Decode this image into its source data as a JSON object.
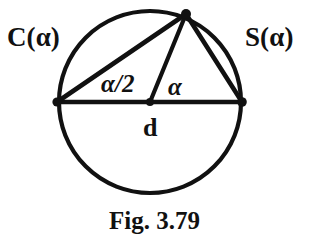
{
  "figure": {
    "caption": "Fig. 3.79",
    "labels": {
      "cosine_chord": "C(α)",
      "sine_chord": "S(α)",
      "inscribed_angle": "α/2",
      "central_angle": "α",
      "diameter": "d"
    },
    "colors": {
      "ink": "#111111",
      "background": "#ffffff"
    },
    "geometry": {
      "circle": {
        "cx": 150,
        "cy": 102,
        "r": 91
      },
      "points": {
        "left_vertex": {
          "x": 57,
          "y": 102
        },
        "right_vertex": {
          "x": 242,
          "y": 102
        },
        "top_vertex": {
          "x": 186,
          "y": 14
        },
        "center": {
          "x": 150,
          "y": 102
        }
      },
      "segments": [
        {
          "name": "diameter",
          "from": "left_vertex",
          "to": "right_vertex"
        },
        {
          "name": "cosine-chord",
          "from": "left_vertex",
          "to": "top_vertex"
        },
        {
          "name": "central-radius",
          "from": "center",
          "to": "top_vertex"
        },
        {
          "name": "sine-chord",
          "from": "top_vertex",
          "to": "right_vertex"
        }
      ]
    }
  }
}
